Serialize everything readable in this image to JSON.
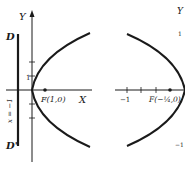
{
  "figure_left": {
    "y_axis_label": "Y",
    "x_axis_label": "X",
    "directrix_top_label": "D",
    "directrix_bottom_label": "D'",
    "directrix_equation": "x = −1",
    "tick_label_1": "1",
    "focus_label": "F(1,0)"
  },
  "figure_right": {
    "y_axis_label": "Y",
    "tick_label_x_neg1": "−1",
    "tick_label_y_1": "1",
    "tick_label_y_neg1": "−1",
    "focus_label": "F(−¼,0)"
  },
  "colors": {
    "ink": "#1a1a1a",
    "background": "#ffffff"
  }
}
